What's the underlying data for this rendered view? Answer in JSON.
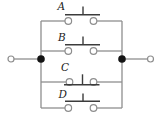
{
  "diagram": {
    "kind": "circuit",
    "switches": [
      {
        "label": "A",
        "state": "open"
      },
      {
        "label": "B",
        "state": "open"
      },
      {
        "label": "C",
        "state": "closed"
      },
      {
        "label": "D",
        "state": "open"
      }
    ]
  },
  "colors": {
    "wire": "#8e8e8e",
    "actuator": "#3c3c3c",
    "node": "#141414",
    "label": "#1c1c1c",
    "background": "#ffffff"
  }
}
